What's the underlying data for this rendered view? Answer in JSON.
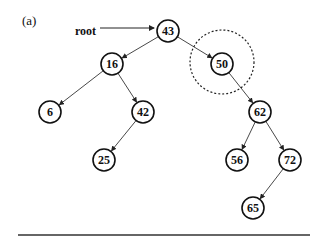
{
  "figure_label": "(a)",
  "root_label": "root",
  "nodes": [
    {
      "id": "43",
      "x": 168,
      "y": 31
    },
    {
      "id": "16",
      "x": 112,
      "y": 64
    },
    {
      "id": "50",
      "x": 222,
      "y": 64
    },
    {
      "id": "6",
      "x": 50,
      "y": 112
    },
    {
      "id": "42",
      "x": 143,
      "y": 112
    },
    {
      "id": "62",
      "x": 260,
      "y": 112
    },
    {
      "id": "25",
      "x": 104,
      "y": 160
    },
    {
      "id": "56",
      "x": 237,
      "y": 160
    },
    {
      "id": "72",
      "x": 290,
      "y": 160
    },
    {
      "id": "65",
      "x": 253,
      "y": 208
    }
  ],
  "edges": [
    [
      "43",
      "16"
    ],
    [
      "43",
      "50"
    ],
    [
      "16",
      "6"
    ],
    [
      "16",
      "42"
    ],
    [
      "42",
      "25"
    ],
    [
      "50",
      "62"
    ],
    [
      "62",
      "56"
    ],
    [
      "62",
      "72"
    ],
    [
      "72",
      "65"
    ]
  ],
  "highlight": {
    "node": "50",
    "radius": 32
  }
}
